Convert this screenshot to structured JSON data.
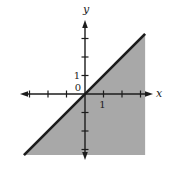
{
  "figure": {
    "colors": {
      "background": "#ffffff",
      "region_fill": "#a8a8a8",
      "boundary_line": "#1c1c1c",
      "axis": "#1c1c1c",
      "text": "#1c1c1c"
    }
  },
  "chart_data": {
    "type": "area",
    "title": "",
    "xlabel": "x",
    "ylabel": "y",
    "xlim": [
      -3.5,
      3.7
    ],
    "ylim": [
      -3.6,
      4.0
    ],
    "x_ticks": [
      -3,
      -2,
      -1,
      1,
      2,
      3
    ],
    "y_ticks": [
      -3,
      -2,
      -1,
      1,
      2,
      3
    ],
    "origin_label": "0",
    "x_unit_label": "1",
    "y_unit_label": "1",
    "grid": false,
    "legend": false,
    "boundary_line": {
      "equation": "y = x",
      "style": "solid",
      "points": [
        [
          -3.3,
          -3.3
        ],
        [
          3.25,
          3.25
        ]
      ]
    },
    "shaded_region": {
      "inequality": "y <= x",
      "boundary_included": true,
      "vertices": [
        [
          -3.3,
          -3.3
        ],
        [
          3.25,
          3.25
        ],
        [
          3.25,
          -3.3
        ]
      ]
    }
  }
}
